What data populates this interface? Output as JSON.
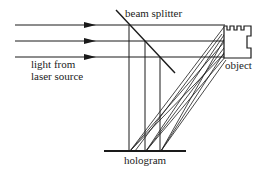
{
  "diagram": {
    "labels": {
      "beam_splitter": "beam splitter",
      "light_source_line1": "light from",
      "light_source_line2": "laser source",
      "object": "object",
      "hologram": "hologram"
    },
    "colors": {
      "line": "#1a1a1a",
      "background": "#ffffff"
    }
  }
}
